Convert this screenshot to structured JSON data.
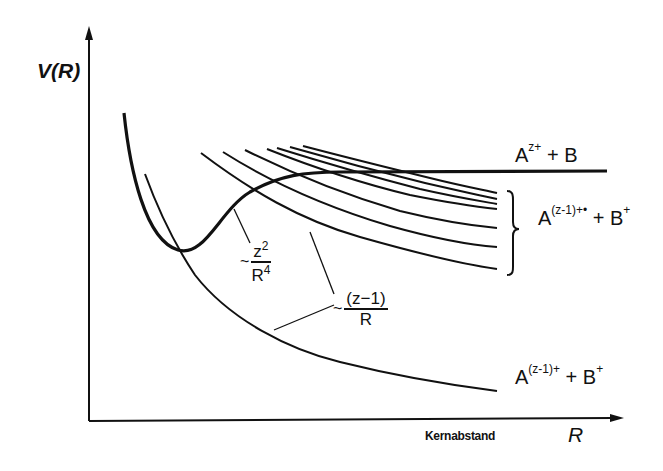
{
  "diagram": {
    "type": "potential-energy-curves",
    "axes": {
      "y_label": "V(R)",
      "x_label": "R",
      "x_caption": "Kernabstand"
    },
    "states": [
      {
        "id": "top",
        "base": "A",
        "sup": "z+",
        "rest": " + B"
      },
      {
        "id": "mid",
        "base": "A",
        "sup": "(z-1)+•",
        "rest": " + B",
        "rest_sup": "+"
      },
      {
        "id": "bot",
        "base": "A",
        "sup": "(z-1)+",
        "rest": " + B",
        "rest_sup": "+"
      }
    ],
    "annotations": [
      {
        "id": "polarization",
        "tilde": "~",
        "numerator": "z",
        "numerator_sup": "2",
        "denominator": "R",
        "denominator_sup": "4"
      },
      {
        "id": "coulomb",
        "tilde": "~",
        "numerator": "(z−1)",
        "denominator": "R"
      }
    ],
    "colors": {
      "ink": "#111111",
      "background": "#ffffff"
    }
  }
}
